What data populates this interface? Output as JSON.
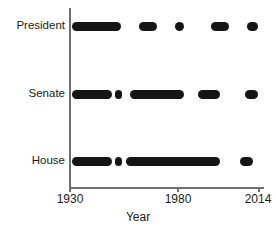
{
  "chart_data": {
    "type": "scatter",
    "title": "",
    "subtitle": "",
    "xlabel": "Year",
    "ylabel": "",
    "xlim": [
      1930,
      2014
    ],
    "ylim": [
      0,
      3
    ],
    "grid": false,
    "legend": null,
    "marker_color": "#151515",
    "axis_color": "#6f6f6f",
    "categories": [
      "President",
      "Senate",
      "House"
    ],
    "x_ticks": [
      1930,
      1980,
      2014
    ],
    "x_tick_labels": [
      "1930",
      "1980",
      "2014"
    ],
    "series": [
      {
        "name": "President",
        "category": "President",
        "segments": [
          {
            "start": 1931,
            "end": 1953
          },
          {
            "start": 1961,
            "end": 1969
          },
          {
            "start": 1977,
            "end": 1981
          },
          {
            "start": 1993,
            "end": 2001
          },
          {
            "start": 2009,
            "end": 2014
          }
        ]
      },
      {
        "name": "Senate",
        "category": "Senate",
        "segments": [
          {
            "start": 1931,
            "end": 1949
          },
          {
            "start": 1950,
            "end": 1953
          },
          {
            "start": 1957,
            "end": 1981
          },
          {
            "start": 1987,
            "end": 1997
          },
          {
            "start": 2008,
            "end": 2014
          }
        ]
      },
      {
        "name": "House",
        "category": "House",
        "segments": [
          {
            "start": 1931,
            "end": 1949
          },
          {
            "start": 1950,
            "end": 1953
          },
          {
            "start": 1955,
            "end": 1997
          },
          {
            "start": 2006,
            "end": 2012
          }
        ]
      }
    ]
  },
  "axis": {
    "x_title": "Year",
    "tick_1": "1930",
    "tick_2": "1980",
    "tick_3": "2014"
  },
  "labels": {
    "president": "President",
    "senate": "Senate",
    "house": "House"
  }
}
